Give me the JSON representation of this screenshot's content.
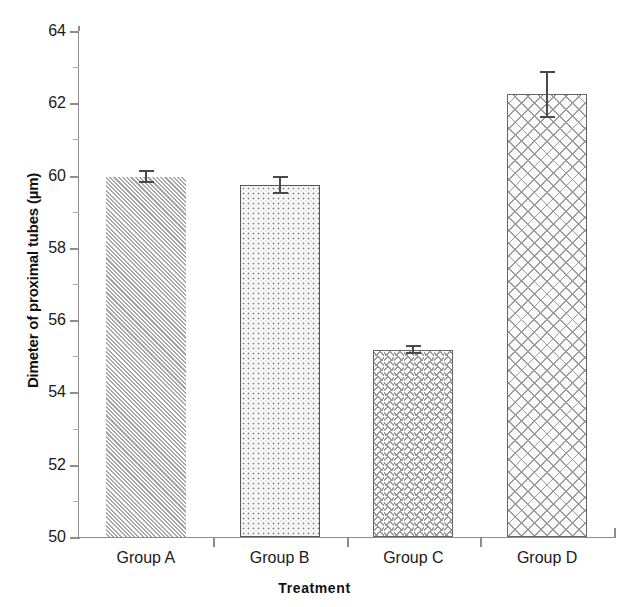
{
  "chart_data": {
    "type": "bar",
    "title": "",
    "xlabel": "Treatment",
    "ylabel": "Dimeter of proximal tubes (µm)",
    "categories": [
      "Group A",
      "Group B",
      "Group C",
      "Group D"
    ],
    "values": [
      59.97,
      59.73,
      55.18,
      62.25
    ],
    "errors": [
      0.18,
      0.25,
      0.13,
      0.65
    ],
    "ylim": [
      50,
      64
    ],
    "yticks": [
      50,
      52,
      54,
      56,
      58,
      60,
      62,
      64
    ],
    "ytick_labels": [
      "50",
      "52",
      "54",
      "56",
      "58",
      "60",
      "62",
      "64"
    ],
    "grid": false,
    "legend": "none",
    "bar_patterns": [
      "diagonal-hatch",
      "stipple-dots",
      "zigzag-herringbone",
      "crosshatch-lattice"
    ]
  },
  "axes": {
    "y_title": "Dimeter of proximal tubes (µm)",
    "x_title": "Treatment"
  },
  "colors": {
    "background": "#ffffff",
    "axis": "#8d8d8d",
    "text": "#1a1a1a",
    "bar_fill": "#f4f4f4",
    "bar_pattern": "#9a9a9a",
    "bar_border": "#5a5a5a",
    "error_bar": "#4a4a4a"
  }
}
